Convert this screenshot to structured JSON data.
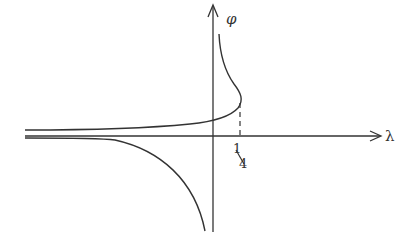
{
  "diagram": {
    "axes": {
      "x_label": "λ",
      "y_label": "φ"
    },
    "tick": {
      "numerator": "1",
      "denominator": "4",
      "meaning": "λ = 1/4"
    },
    "colors": {
      "ink": "#333333",
      "background": "#ffffff"
    },
    "curves": [
      {
        "name": "upper-branch",
        "description": "rises from left asymptote toward φ-axis, reaches max λ = 1/4, then turns back toward φ-axis going up"
      },
      {
        "name": "lower-branch",
        "description": "descends from left asymptote toward -∞ near φ-axis"
      }
    ]
  }
}
